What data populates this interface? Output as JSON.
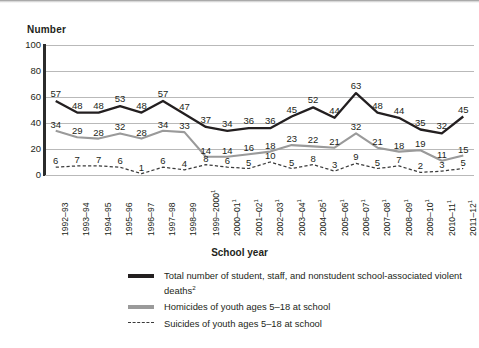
{
  "axes": {
    "y_title": "Number",
    "x_title": "School year",
    "y_ticks": [
      "100",
      "80",
      "60",
      "40",
      "20",
      "0"
    ]
  },
  "legend": {
    "total_label": "Total number of student, staff, and nonstudent school-associated violent deaths",
    "total_footnote": "2",
    "homicides_label": "Homicides of youth ages 5–18 at school",
    "suicides_label": "Suicides of youth ages 5–18 at school"
  },
  "colors": {
    "total": "#231f20",
    "homicides": "#9a9a9a",
    "suicides": "#3a3a3a",
    "grid": "#b9b9b9",
    "axis": "#2b2b2b",
    "background": "#ffffff"
  },
  "chart_data": {
    "type": "line",
    "title": "",
    "xlabel": "School year",
    "ylabel": "Number",
    "ylim": [
      0,
      100
    ],
    "yticks": [
      0,
      20,
      40,
      60,
      80,
      100
    ],
    "grid": true,
    "legend_position": "bottom",
    "categories": [
      "1992–93",
      "1993–94",
      "1994–95",
      "1995–96",
      "1996–97",
      "1997–98",
      "1998–99",
      "1999–2000",
      "2000–01",
      "2001–02",
      "2002–03",
      "2003–04",
      "2004–05",
      "2005–06",
      "2006–07",
      "2007–08",
      "2008–09",
      "2009–10",
      "2010–11",
      "2011–12"
    ],
    "category_footnotes": [
      "",
      "",
      "",
      "",
      "",
      "",
      "",
      "1",
      "1",
      "1",
      "1",
      "1",
      "1",
      "1",
      "1",
      "1",
      "1",
      "1",
      "1",
      "1"
    ],
    "series": [
      {
        "name": "Total number of student, staff, and nonstudent school-associated violent deaths",
        "style": "solid-thick",
        "color": "#231f20",
        "values": [
          57,
          48,
          48,
          53,
          48,
          57,
          47,
          37,
          34,
          36,
          36,
          45,
          52,
          44,
          63,
          48,
          44,
          35,
          32,
          45
        ]
      },
      {
        "name": "Homicides of youth ages 5–18 at school",
        "style": "solid-gray",
        "color": "#9a9a9a",
        "values": [
          34,
          29,
          28,
          32,
          28,
          34,
          33,
          14,
          14,
          16,
          18,
          23,
          22,
          21,
          32,
          21,
          18,
          19,
          11,
          15
        ]
      },
      {
        "name": "Suicides of youth ages 5–18 at school",
        "style": "dashed",
        "color": "#3a3a3a",
        "values": [
          6,
          7,
          7,
          6,
          1,
          6,
          4,
          8,
          6,
          5,
          10,
          5,
          8,
          3,
          9,
          5,
          7,
          2,
          3,
          5
        ]
      }
    ]
  }
}
